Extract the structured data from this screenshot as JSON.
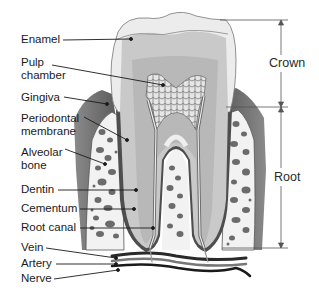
{
  "diagram": {
    "labels": [
      {
        "id": "enamel",
        "text": "Enamel"
      },
      {
        "id": "pulp-chamber-1",
        "text": "Pulp"
      },
      {
        "id": "pulp-chamber-2",
        "text": "chamber"
      },
      {
        "id": "gingiva",
        "text": "Gingiva"
      },
      {
        "id": "periodontal-1",
        "text": "Periodontal"
      },
      {
        "id": "periodontal-2",
        "text": "membrane"
      },
      {
        "id": "alveolar-1",
        "text": "Alveolar"
      },
      {
        "id": "alveolar-2",
        "text": "bone"
      },
      {
        "id": "dentin",
        "text": "Dentin"
      },
      {
        "id": "cementum",
        "text": "Cementum"
      },
      {
        "id": "root-canal",
        "text": "Root canal"
      },
      {
        "id": "vein",
        "text": "Vein"
      },
      {
        "id": "artery",
        "text": "Artery"
      },
      {
        "id": "nerve",
        "text": "Nerve"
      }
    ],
    "regions": {
      "crown": "Crown",
      "root": "Root"
    },
    "colors": {
      "enamel": "#ececec",
      "dentin": "#c8c8c8",
      "pulp": "#b4b4b4",
      "gingiva": "#6e6e6e",
      "bone": "#f4f4f4",
      "bone_spots": "#6a6a6a",
      "leader": "#1a1a1a"
    }
  }
}
